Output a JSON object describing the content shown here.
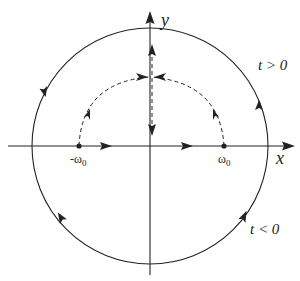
{
  "diagram": {
    "type": "contour-plane",
    "axes": {
      "x_label": "x",
      "y_label": "y"
    },
    "points": [
      {
        "id": "neg-omega0",
        "label": "-ω",
        "subscript": "0",
        "x": 79,
        "y": 146
      },
      {
        "id": "pos-omega0",
        "label": "ω",
        "subscript": "0",
        "x": 224,
        "y": 146
      }
    ],
    "regions": {
      "upper": "t > 0",
      "lower": "t < 0"
    },
    "contour": {
      "shape": "circle",
      "style": "solid",
      "orientation": "counterclockwise"
    },
    "trajectories": {
      "style": "dashed",
      "description": "poles move along semicircular paths from -ω0 and ω0 to meet on the y-axis, then split vertically"
    },
    "colors": {
      "stroke": "#222222",
      "background": "#ffffff"
    }
  }
}
